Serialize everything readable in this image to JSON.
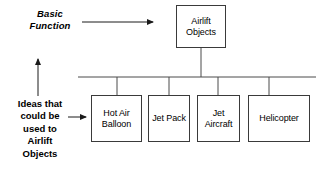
{
  "diagram": {
    "type": "function-tree",
    "title_node": {
      "id": "airlift-objects",
      "label": "Airlift\nObjects",
      "x": 176,
      "y": 5,
      "w": 50,
      "h": 43
    },
    "annotations": [
      {
        "id": "basic-function",
        "text": "Basic\nFunction",
        "style": "bold-italic",
        "points_to": "airlift-objects",
        "arrow": {
          "x1": 82,
          "y1": 22,
          "x2": 158,
          "y2": 22,
          "orientation": "horizontal-right"
        }
      },
      {
        "id": "ideas-that-could-be-used",
        "text": "Ideas that\ncould be\nused to\nAirlift\nObjects",
        "style": "bold",
        "points_to": "solution-row",
        "arrows": [
          {
            "x1": 38,
            "y1": 96,
            "x2": 38,
            "y2": 54,
            "orientation": "vertical-up"
          },
          {
            "x1": 68,
            "y1": 117,
            "x2": 90,
            "y2": 117,
            "orientation": "horizontal-right"
          }
        ]
      }
    ],
    "bus_line": {
      "x1": 78,
      "y": 77,
      "x2": 316
    },
    "trunk_line": {
      "x": 201,
      "y1": 48,
      "y2": 77
    },
    "children": [
      {
        "id": "hot-air-balloon",
        "label": "Hot Air\nBalloon",
        "x": 91,
        "y": 95,
        "w": 51,
        "h": 47,
        "connector_x": 117
      },
      {
        "id": "jet-pack",
        "label": "Jet\nPack",
        "x": 148,
        "y": 95,
        "w": 42,
        "h": 47,
        "connector_x": 169
      },
      {
        "id": "jet-aircraft",
        "label": "Jet\nAircraft",
        "x": 197,
        "y": 95,
        "w": 43,
        "h": 47,
        "connector_x": 218
      },
      {
        "id": "helicopter",
        "label": "Helicopter",
        "x": 248,
        "y": 95,
        "w": 62,
        "h": 47,
        "connector_x": 269
      }
    ],
    "colors": {
      "background": "#ffffff",
      "box_border": "#3a3a3a",
      "line": "#4a4a4a",
      "text": "#000000"
    }
  }
}
